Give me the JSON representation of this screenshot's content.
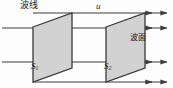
{
  "figure": {
    "type": "physics-diagram",
    "background_color": "#fdfdfd",
    "labels": {
      "wave_line": "波线",
      "velocity": "u",
      "wavefront": "波面",
      "surface_1": "S",
      "surface_1_sub": "1",
      "surface_2": "S",
      "surface_2_sub": "2"
    },
    "colors": {
      "plane_fill": "#d2d2d2",
      "plane_stroke": "#3a3a3a",
      "ray_stroke": "#3d3d3d",
      "text": "#1a1a1a"
    },
    "geometry": {
      "plane_1": {
        "points": "33,27 72,13 72,68 33,82"
      },
      "plane_2": {
        "points": "106,27 145,13 145,68 106,82"
      },
      "rays": [
        {
          "name": "ray-top",
          "y_left": 13,
          "x_start": 33,
          "x_end": 168
        },
        {
          "name": "ray-upper",
          "y_left": 28,
          "x_start": 2,
          "x_end": 168
        },
        {
          "name": "ray-lower",
          "y_left": 62,
          "x_start": 2,
          "x_end": 168
        },
        {
          "name": "ray-bottom",
          "y_left": 82,
          "x_start": 33,
          "x_end": 168
        }
      ],
      "inner_arrow_heads": [
        {
          "name": "arrow-head-s2-upper",
          "x": 152,
          "y": 28
        },
        {
          "name": "arrow-head-s2-top",
          "x": 152,
          "y": 13
        }
      ]
    }
  }
}
